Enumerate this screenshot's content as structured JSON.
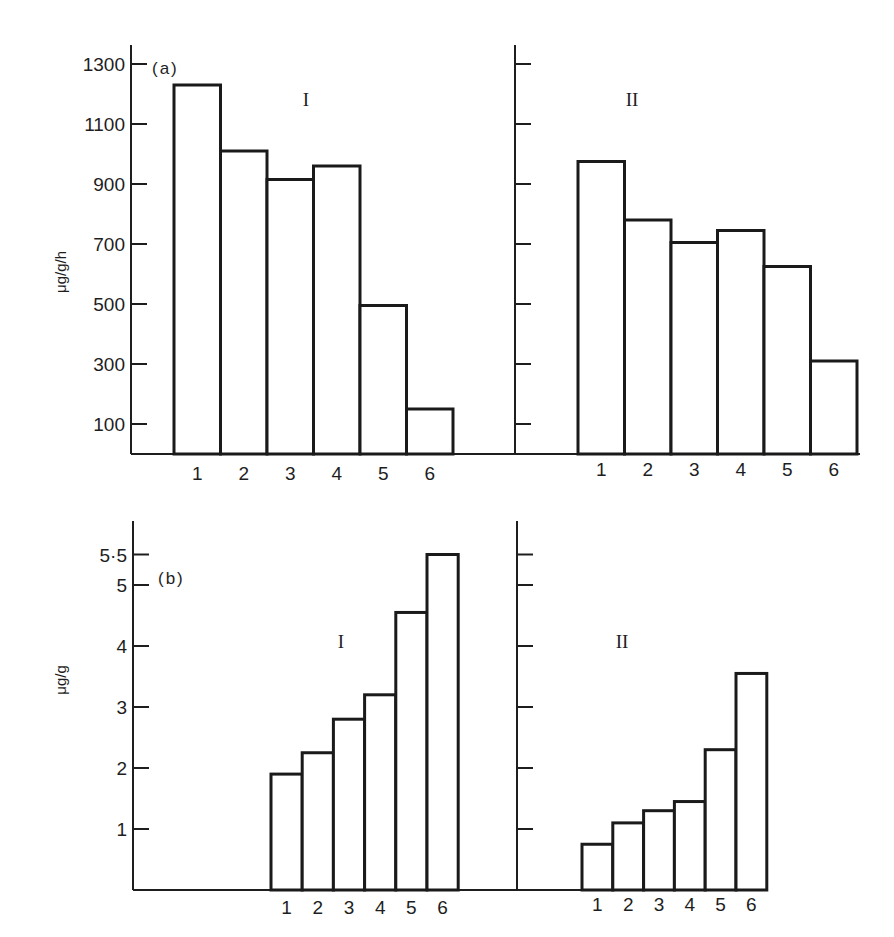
{
  "figure": {
    "panels": {
      "a": {
        "tag": "(a)",
        "ylabel": "μg/g/h"
      },
      "b": {
        "tag": "(b)",
        "ylabel": "μg/g"
      }
    },
    "groups": {
      "I": "I",
      "II": "II"
    }
  },
  "chart_data": [
    {
      "type": "bar",
      "panel": "(a)",
      "title": "",
      "xlabel": "",
      "ylabel": "μg/g/h",
      "categories": [
        "1",
        "2",
        "3",
        "4",
        "5",
        "6"
      ],
      "series": [
        {
          "name": "I",
          "values": [
            1230,
            1010,
            915,
            960,
            495,
            150
          ]
        },
        {
          "name": "II",
          "values": [
            975,
            780,
            705,
            745,
            625,
            310
          ]
        }
      ],
      "yticks": [
        100,
        300,
        500,
        700,
        900,
        1100,
        1300
      ],
      "ytick_labels": [
        "100",
        "300",
        "500",
        "700",
        "900",
        "1100",
        "1300"
      ],
      "ylim": [
        0,
        1360
      ],
      "grid": false,
      "legend": "none (sub-panels labelled I and II)"
    },
    {
      "type": "bar",
      "panel": "(b)",
      "title": "",
      "xlabel": "",
      "ylabel": "μg/g",
      "categories": [
        "1",
        "2",
        "3",
        "4",
        "5",
        "6"
      ],
      "series": [
        {
          "name": "I",
          "values": [
            1.9,
            2.25,
            2.8,
            3.2,
            4.55,
            5.5
          ]
        },
        {
          "name": "II",
          "values": [
            0.75,
            1.1,
            1.3,
            1.45,
            2.3,
            3.55
          ]
        }
      ],
      "yticks": [
        1,
        2,
        3,
        4,
        5,
        5.5
      ],
      "ytick_labels": [
        "1",
        "2",
        "3",
        "4",
        "5",
        "5·5"
      ],
      "ylim": [
        0,
        6.1
      ],
      "grid": false,
      "legend": "none (sub-panels labelled I and II)"
    }
  ]
}
